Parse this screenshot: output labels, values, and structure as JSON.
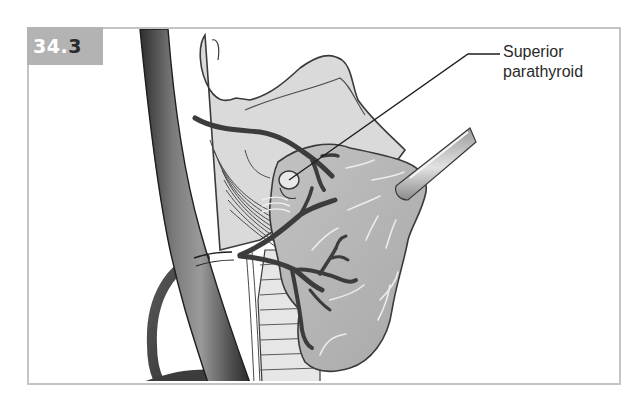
{
  "figure": {
    "number_prefix": "34.",
    "number_suffix": "3",
    "number_full": "34.3",
    "badge_color": "#b3b3b3",
    "frame_color": "#c4c4c4"
  },
  "callouts": [
    {
      "id": "superior-parathyroid",
      "lines": [
        "Superior",
        "parathyroid"
      ],
      "text": "Superior parathyroid"
    }
  ],
  "illustration": {
    "subject": "thyroid lobe retracted with forceps showing superior parathyroid gland and vascular branches",
    "elements": [
      "common-carotid-artery",
      "thyroid-cartilage",
      "thyroid-lobe",
      "trachea",
      "superior-parathyroid-gland",
      "inferior-thyroid-artery-branches",
      "retractor-forceps",
      "recurrent-laryngeal-nerve-loop"
    ],
    "colors": {
      "vessel_dark": "#3c3c3c",
      "vessel_mid": "#6a6a6a",
      "tissue_light": "#d2d2d2",
      "tissue_mid": "#b8b8b8",
      "outline": "#3a3a3a"
    }
  }
}
